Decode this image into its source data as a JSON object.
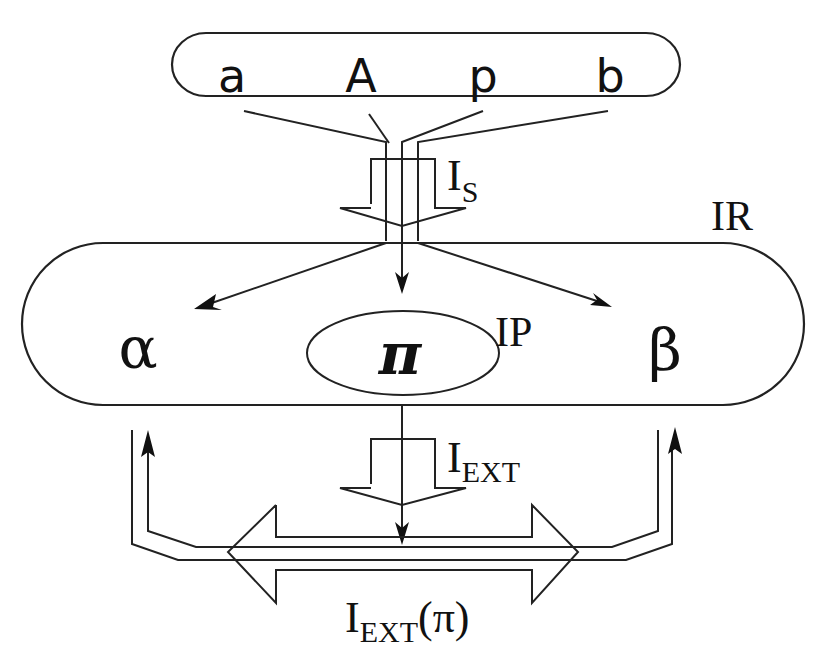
{
  "diagram": {
    "top_fragment_text": "",
    "source_box": {
      "symbols": [
        "a",
        "A",
        "p",
        "b"
      ]
    },
    "labels": {
      "is_main": "I",
      "is_sub": "S",
      "ir": "IR",
      "ip": "IP",
      "iext_main": "I",
      "iext_sub": "EXT",
      "iext_pi_main": "I",
      "iext_pi_sub": "EXT",
      "iext_pi_arg": "(π)"
    },
    "ir_box": {
      "alpha": "α",
      "pi": "π",
      "beta": "β"
    },
    "colors": {
      "stroke": "#222222",
      "background": "#ffffff"
    }
  }
}
